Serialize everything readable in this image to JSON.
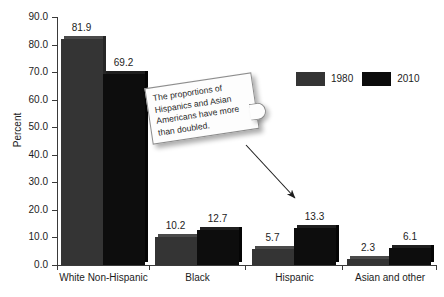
{
  "chart_data": {
    "type": "bar",
    "title": "",
    "xlabel": "",
    "ylabel": "Percent",
    "ylim": [
      0,
      90
    ],
    "ytick_step": 10,
    "ytick_labels": [
      "0.0",
      "10.0",
      "20.0",
      "30.0",
      "40.0",
      "50.0",
      "60.0",
      "70.0",
      "80.0",
      "90.0"
    ],
    "grid": false,
    "legend_position": "top-right",
    "categories": [
      "White Non-Hispanic",
      "Black",
      "Hispanic",
      "Asian and other"
    ],
    "series": [
      {
        "name": "1980",
        "color": "#343434",
        "values": [
          81.9,
          10.2,
          5.7,
          2.3
        ]
      },
      {
        "name": "2010",
        "color": "#0b0b0b",
        "values": [
          69.2,
          12.7,
          13.3,
          6.1
        ]
      }
    ],
    "data_labels": [
      "81.9",
      "69.2",
      "10.2",
      "12.7",
      "5.7",
      "13.3",
      "2.3",
      "6.1"
    ],
    "annotations": [
      {
        "kind": "callout",
        "text": "The proportions of Hispanics and Asian Americans have more than doubled.",
        "points_to": "Hispanic"
      }
    ]
  },
  "legend": {
    "entries": [
      {
        "label": "1980",
        "swatch": "legend-swatch-1980"
      },
      {
        "label": "2010",
        "swatch": "legend-swatch-2010"
      }
    ]
  },
  "callout": {
    "text": "The proportions of Hispanics and Asian Americans have more than doubled."
  },
  "axis": {
    "y_title": "Percent"
  }
}
